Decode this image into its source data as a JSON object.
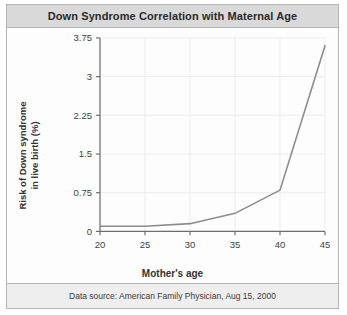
{
  "figure": {
    "title": "Down Syndrome Correlation with Maternal Age",
    "footer": "Data source: American Family Physician, Aug 15, 2000",
    "frame_color": "#b4b4b4",
    "title_bar_color": "#d9d9d9",
    "line_color": "#8c8c8c",
    "grid_color": "#ececec",
    "axis_color": "#6e6e6e"
  },
  "chart_data": {
    "type": "line",
    "title": "Down Syndrome Correlation with Maternal Age",
    "xlabel": "Mother's age",
    "ylabel": "Risk of Down syndrome in live birth (%)",
    "ylabel_line1": "Risk of Down syndrome",
    "ylabel_line2": "in live birth (%)",
    "x": [
      20,
      25,
      30,
      35,
      40,
      45
    ],
    "values": [
      0.1,
      0.1,
      0.15,
      0.35,
      0.8,
      3.6
    ],
    "series": [
      {
        "name": "Risk of Down syndrome in live birth (%)",
        "values": [
          0.1,
          0.1,
          0.15,
          0.35,
          0.8,
          3.6
        ]
      }
    ],
    "xlim": [
      20,
      45
    ],
    "ylim": [
      0,
      3.75
    ],
    "xticks": [
      20,
      25,
      30,
      35,
      40,
      45
    ],
    "yticks": [
      0,
      0.75,
      1.5,
      2.25,
      3,
      3.75
    ],
    "xtick_labels": [
      "20",
      "25",
      "30",
      "35",
      "40",
      "45"
    ],
    "ytick_labels": [
      "0",
      "0.75",
      "1.5",
      "2.25",
      "3",
      "3.75"
    ],
    "grid": true,
    "legend": false,
    "legend_position": "none",
    "annotations": [
      "Data source: American Family Physician, Aug 15, 2000"
    ]
  }
}
